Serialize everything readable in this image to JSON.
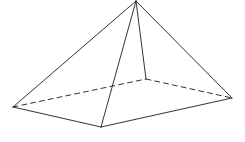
{
  "diagram": {
    "type": "square-pyramid",
    "width": 245,
    "height": 142,
    "background": "#ffffff",
    "stroke_color": "#333333",
    "stroke_width": 1,
    "dash_pattern": "5,4",
    "vertices": {
      "apex": [
        136,
        1
      ],
      "left": [
        13,
        107
      ],
      "front": [
        101,
        127
      ],
      "right": [
        232,
        98
      ],
      "back": [
        146,
        79
      ]
    },
    "edges": [
      {
        "from": "apex",
        "to": "left",
        "style": "solid"
      },
      {
        "from": "apex",
        "to": "front",
        "style": "solid"
      },
      {
        "from": "apex",
        "to": "right",
        "style": "solid"
      },
      {
        "from": "apex",
        "to": "back",
        "style": "solid"
      },
      {
        "from": "left",
        "to": "front",
        "style": "solid"
      },
      {
        "from": "front",
        "to": "right",
        "style": "solid"
      },
      {
        "from": "left",
        "to": "back",
        "style": "dashed"
      },
      {
        "from": "back",
        "to": "right",
        "style": "dashed"
      }
    ]
  }
}
